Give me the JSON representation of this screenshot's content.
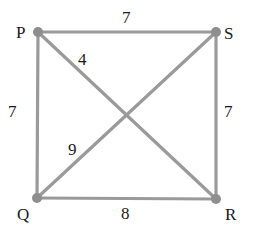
{
  "diagram": {
    "type": "weighted-graph",
    "colors": {
      "edge": "#9a9a9a",
      "node": "#8e8e8e",
      "text": "#1a1a1a",
      "background": "#ffffff"
    },
    "nodes": [
      {
        "id": "P",
        "label": "P",
        "x": 38,
        "y": 32
      },
      {
        "id": "S",
        "label": "S",
        "x": 216,
        "y": 32
      },
      {
        "id": "Q",
        "label": "Q",
        "x": 37,
        "y": 198
      },
      {
        "id": "R",
        "label": "R",
        "x": 216,
        "y": 199
      }
    ],
    "edges": [
      {
        "from": "P",
        "to": "S",
        "weight": "7"
      },
      {
        "from": "P",
        "to": "Q",
        "weight": "7"
      },
      {
        "from": "S",
        "to": "R",
        "weight": "7"
      },
      {
        "from": "Q",
        "to": "R",
        "weight": "8"
      },
      {
        "from": "P",
        "to": "R",
        "weight": "4"
      },
      {
        "from": "Q",
        "to": "S",
        "weight": "9"
      }
    ]
  }
}
